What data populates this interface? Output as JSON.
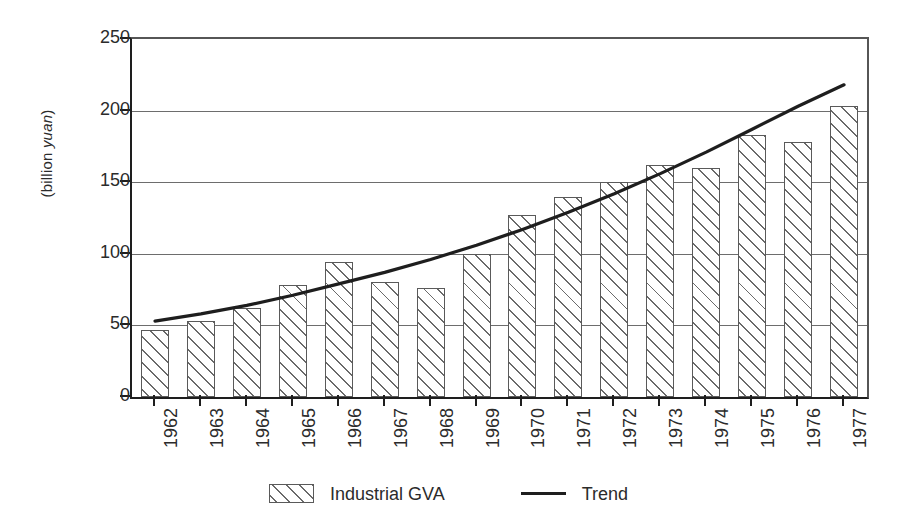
{
  "chart_data": {
    "type": "bar",
    "title": "",
    "xlabel": "",
    "ylabel_prefix": "(billion ",
    "ylabel_italic": "yuan",
    "ylabel_suffix": ")",
    "ylabel": "(billion yuan)",
    "ylim": [
      0,
      250
    ],
    "ytick_values": [
      250,
      200,
      150,
      100,
      50,
      0
    ],
    "ytick_labels": [
      "250",
      "200",
      "150",
      "100",
      "50",
      "0"
    ],
    "grid": true,
    "grid_axis": "y",
    "legend_position": "bottom-center",
    "categories": [
      "1962",
      "1963",
      "1964",
      "1965",
      "1966",
      "1967",
      "1968",
      "1969",
      "1970",
      "1971",
      "1972",
      "1973",
      "1974",
      "1975",
      "1976",
      "1977"
    ],
    "series": [
      {
        "name": "Industrial GVA",
        "type": "bar",
        "pattern": "diagonal-hatch",
        "values": [
          47,
          53,
          62,
          78,
          94,
          80,
          76,
          100,
          127,
          140,
          150,
          162,
          160,
          183,
          178,
          203
        ]
      },
      {
        "name": "Trend",
        "type": "line",
        "color": "#1e1e1e",
        "values": [
          53,
          58,
          64,
          71,
          79,
          87,
          96,
          106,
          117,
          129,
          142,
          156,
          171,
          187,
          203,
          218
        ]
      }
    ],
    "legend": [
      {
        "label": "Industrial GVA",
        "marker": "hatched-swatch"
      },
      {
        "label": "Trend",
        "marker": "line"
      }
    ]
  },
  "colors": {
    "axis": "#1e1e1e",
    "grid": "#6d6d6d",
    "hatch": "#6a6a6a",
    "background": "#ffffff",
    "text": "#2b2b2b"
  }
}
